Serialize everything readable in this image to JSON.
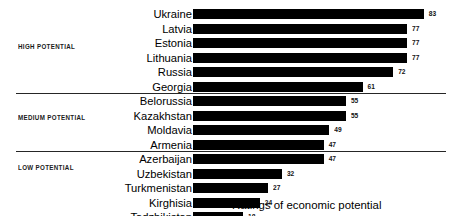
{
  "caption": "Ratings of economic potential",
  "chart_data": {
    "type": "bar",
    "orientation": "horizontal",
    "title": "",
    "subtitle": "",
    "xlabel": "Ratings of economic potential",
    "ylabel": "",
    "xlim": [
      0,
      90
    ],
    "grid": false,
    "legend": null,
    "value_labels": true,
    "bar_color": "#000000",
    "categories": [
      "Ukraine",
      "Latvia",
      "Estonia",
      "Lithuania",
      "Russia",
      "Georgia",
      "Belorussia",
      "Kazakhstan",
      "Moldavia",
      "Armenia",
      "Azerbaijan",
      "Uzbekistan",
      "Turkmenistan",
      "Kirghisia",
      "Tadzhikistan"
    ],
    "values": [
      83,
      77,
      77,
      77,
      72,
      61,
      55,
      55,
      49,
      47,
      47,
      32,
      27,
      24,
      18
    ],
    "groups": [
      {
        "label": "HIGH POTENTIAL",
        "start": 0,
        "end": 5
      },
      {
        "label": "MEDIUM POTENTIAL",
        "start": 6,
        "end": 9
      },
      {
        "label": "LOW POTENTIAL",
        "start": 10,
        "end": 14
      }
    ],
    "rows": [
      {
        "name": "Ukraine",
        "value": 83,
        "group": "HIGH POTENTIAL"
      },
      {
        "name": "Latvia",
        "value": 77,
        "group": "HIGH POTENTIAL"
      },
      {
        "name": "Estonia",
        "value": 77,
        "group": "HIGH POTENTIAL"
      },
      {
        "name": "Lithuania",
        "value": 77,
        "group": "HIGH POTENTIAL"
      },
      {
        "name": "Russia",
        "value": 72,
        "group": "HIGH POTENTIAL"
      },
      {
        "name": "Georgia",
        "value": 61,
        "group": "HIGH POTENTIAL"
      },
      {
        "name": "Belorussia",
        "value": 55,
        "group": "MEDIUM POTENTIAL"
      },
      {
        "name": "Kazakhstan",
        "value": 55,
        "group": "MEDIUM POTENTIAL"
      },
      {
        "name": "Moldavia",
        "value": 49,
        "group": "MEDIUM POTENTIAL"
      },
      {
        "name": "Armenia",
        "value": 47,
        "group": "MEDIUM POTENTIAL"
      },
      {
        "name": "Azerbaijan",
        "value": 47,
        "group": "LOW POTENTIAL"
      },
      {
        "name": "Uzbekistan",
        "value": 32,
        "group": "LOW POTENTIAL"
      },
      {
        "name": "Turkmenistan",
        "value": 27,
        "group": "LOW POTENTIAL"
      },
      {
        "name": "Kirghisia",
        "value": 24,
        "group": "LOW POTENTIAL"
      },
      {
        "name": "Tadzhikistan",
        "value": 18,
        "group": "LOW POTENTIAL"
      }
    ]
  },
  "layout": {
    "bar_origin_x": 193,
    "px_per_unit": 2.78,
    "row_pitch": 14.5,
    "first_row_top": 8.0,
    "dividers_after_row_index": [
      5,
      9
    ],
    "group_label_tops": [
      43,
      114,
      164
    ]
  }
}
